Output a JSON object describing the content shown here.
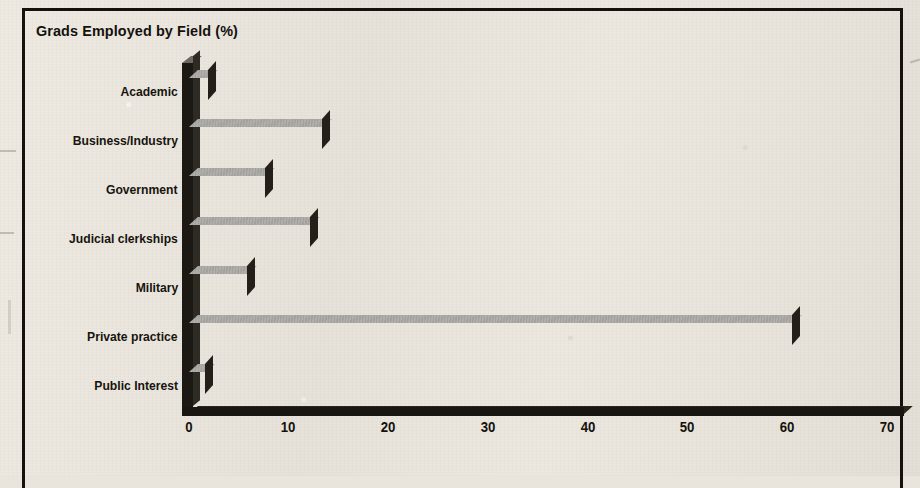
{
  "chart_data": {
    "type": "bar",
    "orientation": "horizontal",
    "style": "3d-printed-scan",
    "title": "Grads Employed by Field (%)",
    "xlabel": "",
    "ylabel": "",
    "categories": [
      "Academic",
      "Business/Industry",
      "Government",
      "Judicial clerkships",
      "Military",
      "Private practice",
      "Public Interest"
    ],
    "values": [
      2.0,
      13.4,
      7.7,
      12.2,
      5.9,
      60.5,
      1.7
    ],
    "xticks": [
      0,
      10,
      20,
      30,
      40,
      50,
      60,
      70
    ],
    "xtick_labels": [
      "0",
      "10",
      "20",
      "30",
      "40",
      "50",
      "60",
      "70"
    ],
    "xlim": [
      0,
      70
    ],
    "grid": false,
    "legend": false,
    "colors": {
      "bar_front": "#56534e",
      "bar_top": "#b0aeaa",
      "bar_side": "#241f19",
      "axis": "#191611",
      "text": "#14110d",
      "background": "#e9e5dd",
      "frame": "#15120e"
    }
  },
  "frame": {
    "label": "chart-border"
  }
}
